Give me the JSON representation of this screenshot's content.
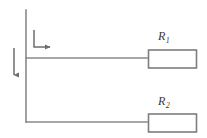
{
  "diagram": {
    "type": "electrical-circuit-schematic",
    "title": "",
    "colors": {
      "background": "#ffffff",
      "wire": "#8a8a8a",
      "component_outline": "#8a8a8a",
      "component_fill": "#ffffff",
      "label_text": "#3a3a3a",
      "arrow": "#6e6e6e"
    },
    "components": [
      {
        "name": "resistor-r1",
        "label": "R",
        "subscript": "1",
        "shape": "rectangle",
        "x": 148,
        "y": 50,
        "width": 48,
        "height": 18
      },
      {
        "name": "resistor-r2",
        "label": "R",
        "subscript": "2",
        "shape": "rectangle",
        "x": 148,
        "y": 114,
        "width": 48,
        "height": 18
      }
    ],
    "wires": [
      {
        "name": "main-vertical-bus",
        "x1": 26,
        "y1": 10,
        "x2": 26,
        "y2": 122
      },
      {
        "name": "branch-wire-to-r1",
        "x1": 26,
        "y1": 58,
        "x2": 148,
        "y2": 58
      },
      {
        "name": "branch-wire-to-r2",
        "x1": 26,
        "y1": 122,
        "x2": 148,
        "y2": 122
      }
    ],
    "annotations": [
      {
        "name": "current-arrow-down",
        "direction": "down",
        "label": "",
        "x1": 14,
        "y1": 48,
        "x2": 14,
        "y2": 78
      },
      {
        "name": "current-arrow-right-bracket",
        "direction": "right",
        "label": "",
        "corner_x": 34,
        "corner_y": 47,
        "vertical_top_y": 30,
        "horizontal_end_x": 53
      }
    ]
  },
  "labels": {
    "r1": {
      "symbol": "R",
      "subscript": "1"
    },
    "r2": {
      "symbol": "R",
      "subscript": "2"
    }
  }
}
